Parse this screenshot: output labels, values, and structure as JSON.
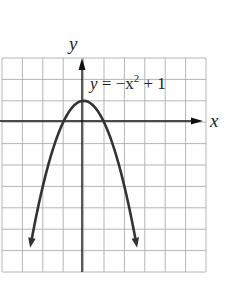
{
  "chart_data": {
    "type": "line",
    "title": "",
    "xlabel": "x",
    "ylabel": "y",
    "xlim": [
      -4,
      6
    ],
    "ylim": [
      -7,
      3
    ],
    "grid": true,
    "annotations": [
      {
        "text": "y = −x² + 1",
        "x": 1,
        "y": 2
      }
    ],
    "series": [
      {
        "name": "y = -x^2 + 1",
        "equation": "y = -x^2 + 1",
        "x": [
          -2.6,
          -2,
          -1.5,
          -1,
          -0.5,
          0,
          0.5,
          1,
          1.5,
          2,
          2.6
        ],
        "y": [
          -5.76,
          -3,
          -1.25,
          0,
          0.75,
          1,
          0.75,
          0,
          -1.25,
          -3,
          -5.76
        ],
        "arrows_at_ends": true
      }
    ]
  },
  "labels": {
    "x_axis": "x",
    "y_axis": "y",
    "equation_y": "y",
    "equation_rest": " = −x",
    "equation_exp": "2",
    "equation_tail": " + 1"
  }
}
